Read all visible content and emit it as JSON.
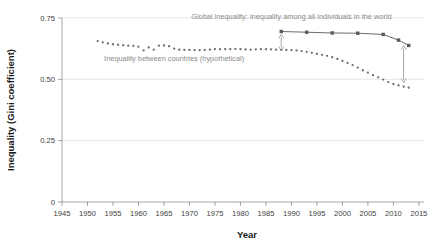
{
  "chart_data": {
    "type": "line",
    "title": "",
    "xlabel": "Year",
    "ylabel": "Inequality (Gini coefficient)",
    "xlim": [
      1945,
      2016
    ],
    "ylim": [
      0,
      0.75
    ],
    "xticks": [
      1945,
      1950,
      1955,
      1960,
      1965,
      1970,
      1975,
      1980,
      1985,
      1990,
      1995,
      2000,
      2005,
      2010,
      2015
    ],
    "xticklabels": [
      "1945",
      "1950",
      "1955",
      "1960",
      "1965",
      "1970",
      "1975",
      "1980",
      "1985",
      "1990",
      "1995",
      "2000",
      "2005",
      "2010",
      "2015"
    ],
    "yticks": [
      0,
      0.25,
      0.5,
      0.75
    ],
    "yticklabels": [
      "0",
      "0.25",
      "0.50",
      "0.75"
    ],
    "grid": "horizontal",
    "legend": "annotations-inline",
    "annotations": [
      {
        "name": "global-inequality-label",
        "text": "Global inequality: inequality among all individuals in the world",
        "x": 1990,
        "y": 0.745,
        "color": "#8a8a8a"
      },
      {
        "name": "between-countries-label",
        "text": "Inequality between countries (hypothetical)",
        "x": 1967,
        "y": 0.575,
        "color": "#8a8a8a"
      },
      {
        "name": "gap-arrow-left",
        "type": "double-arrow",
        "x": 1988,
        "y_top": 0.683,
        "y_bottom": 0.617
      },
      {
        "name": "gap-arrow-right",
        "type": "double-arrow",
        "x": 2012,
        "y_top": 0.638,
        "y_bottom": 0.487
      }
    ],
    "series": [
      {
        "name": "Inequality between countries (hypothetical)",
        "style": "dotted-markers",
        "color": "#6e6e6e",
        "x": [
          1952,
          1953,
          1954,
          1955,
          1956,
          1957,
          1958,
          1959,
          1960,
          1961,
          1962,
          1963,
          1964,
          1965,
          1966,
          1967,
          1968,
          1969,
          1970,
          1971,
          1972,
          1973,
          1974,
          1975,
          1976,
          1977,
          1978,
          1979,
          1980,
          1981,
          1982,
          1983,
          1984,
          1985,
          1986,
          1987,
          1988,
          1989,
          1990,
          1991,
          1992,
          1993,
          1994,
          1995,
          1996,
          1997,
          1998,
          1999,
          2000,
          2001,
          2002,
          2003,
          2004,
          2005,
          2006,
          2007,
          2008,
          2009,
          2010,
          2011,
          2012,
          2013
        ],
        "y": [
          0.656,
          0.651,
          0.646,
          0.643,
          0.641,
          0.639,
          0.637,
          0.636,
          0.633,
          0.618,
          0.63,
          0.621,
          0.637,
          0.638,
          0.635,
          0.625,
          0.621,
          0.62,
          0.62,
          0.619,
          0.619,
          0.62,
          0.621,
          0.623,
          0.623,
          0.623,
          0.623,
          0.624,
          0.623,
          0.622,
          0.621,
          0.622,
          0.623,
          0.623,
          0.622,
          0.621,
          0.62,
          0.62,
          0.619,
          0.618,
          0.615,
          0.612,
          0.608,
          0.604,
          0.6,
          0.596,
          0.59,
          0.583,
          0.575,
          0.567,
          0.558,
          0.548,
          0.537,
          0.527,
          0.517,
          0.508,
          0.499,
          0.489,
          0.481,
          0.475,
          0.47,
          0.466
        ]
      },
      {
        "name": "Global inequality: inequality among all individuals in the world",
        "style": "solid-markers",
        "color": "#5a5a5a",
        "x": [
          1988,
          1993,
          1998,
          2003,
          2008,
          2011,
          2013
        ],
        "y": [
          0.695,
          0.692,
          0.689,
          0.688,
          0.683,
          0.66,
          0.638
        ]
      }
    ]
  }
}
